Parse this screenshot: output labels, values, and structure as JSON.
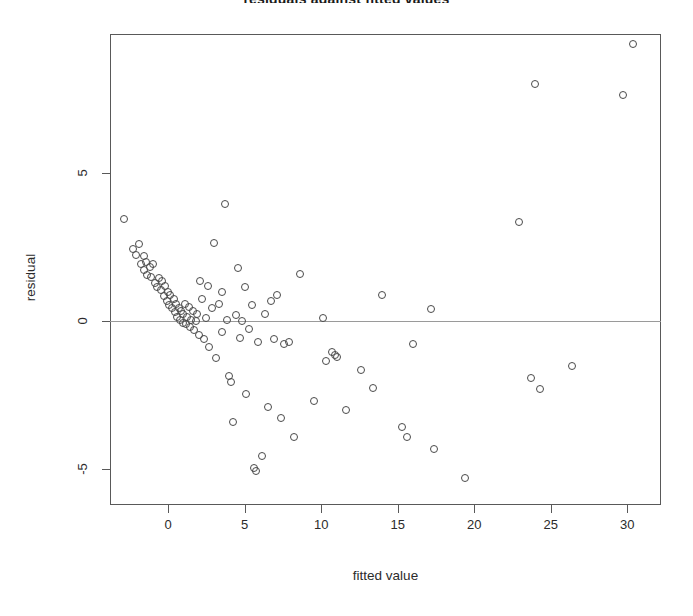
{
  "chart_data": {
    "type": "scatter",
    "title": "residuals against fitted values",
    "xlabel": "fitted value",
    "ylabel": "residual",
    "xlim": [
      -3.8,
      32.2
    ],
    "ylim": [
      -6.2,
      9.7
    ],
    "xticks": [
      0,
      5,
      10,
      15,
      20,
      25,
      30
    ],
    "xticklabels": [
      "0",
      "5",
      "10",
      "15",
      "20",
      "25",
      "30"
    ],
    "yticks": [
      -5,
      0,
      5
    ],
    "yticklabels": [
      "-5",
      "0",
      "5"
    ],
    "grid": false,
    "legend": null,
    "reference_lines": [
      {
        "orientation": "horizontal",
        "y": 0,
        "color": "#9a9a9a"
      }
    ],
    "marker": {
      "shape": "open-circle",
      "size_px": 8,
      "color": "#4a4a4a",
      "fill": "none"
    },
    "n_points": 98,
    "points": [
      [
        -2.9,
        3.45
      ],
      [
        -2.3,
        2.45
      ],
      [
        -2.1,
        2.25
      ],
      [
        -1.9,
        2.6
      ],
      [
        -1.75,
        1.95
      ],
      [
        -1.6,
        2.2
      ],
      [
        -1.55,
        1.75
      ],
      [
        -1.45,
        2.0
      ],
      [
        -1.35,
        1.55
      ],
      [
        -1.2,
        1.85
      ],
      [
        -1.1,
        1.5
      ],
      [
        -1.0,
        1.95
      ],
      [
        -0.85,
        1.3
      ],
      [
        -0.7,
        1.15
      ],
      [
        -0.6,
        1.45
      ],
      [
        -0.5,
        1.05
      ],
      [
        -0.4,
        1.35
      ],
      [
        -0.3,
        0.85
      ],
      [
        -0.2,
        1.2
      ],
      [
        -0.1,
        0.7
      ],
      [
        0.0,
        1.0
      ],
      [
        0.05,
        0.55
      ],
      [
        0.15,
        0.9
      ],
      [
        0.25,
        0.45
      ],
      [
        0.35,
        0.75
      ],
      [
        0.45,
        0.3
      ],
      [
        0.5,
        0.6
      ],
      [
        0.6,
        0.15
      ],
      [
        0.7,
        0.45
      ],
      [
        0.8,
        0.05
      ],
      [
        0.85,
        0.35
      ],
      [
        0.95,
        -0.05
      ],
      [
        1.0,
        0.25
      ],
      [
        1.1,
        0.6
      ],
      [
        1.15,
        -0.1
      ],
      [
        1.25,
        0.15
      ],
      [
        1.35,
        0.5
      ],
      [
        1.45,
        -0.2
      ],
      [
        1.5,
        0.05
      ],
      [
        1.6,
        0.35
      ],
      [
        1.7,
        -0.3
      ],
      [
        1.8,
        0.0
      ],
      [
        1.9,
        0.25
      ],
      [
        2.0,
        -0.45
      ],
      [
        2.1,
        1.35
      ],
      [
        2.2,
        0.75
      ],
      [
        2.35,
        -0.6
      ],
      [
        2.45,
        0.1
      ],
      [
        2.6,
        1.2
      ],
      [
        2.7,
        -0.85
      ],
      [
        2.85,
        0.45
      ],
      [
        3.0,
        2.65
      ],
      [
        3.1,
        -1.25
      ],
      [
        3.3,
        0.6
      ],
      [
        3.5,
        1.0
      ],
      [
        3.55,
        -0.35
      ],
      [
        3.7,
        3.95
      ],
      [
        3.85,
        0.05
      ],
      [
        4.0,
        -1.85
      ],
      [
        4.1,
        -2.05
      ],
      [
        4.25,
        -3.4
      ],
      [
        4.4,
        0.2
      ],
      [
        4.55,
        1.8
      ],
      [
        4.7,
        -0.55
      ],
      [
        4.85,
        0.0
      ],
      [
        5.0,
        1.15
      ],
      [
        5.1,
        -2.45
      ],
      [
        5.3,
        -0.25
      ],
      [
        5.45,
        0.55
      ],
      [
        5.6,
        -4.95
      ],
      [
        5.75,
        -5.05
      ],
      [
        5.9,
        -0.7
      ],
      [
        6.1,
        -4.55
      ],
      [
        6.3,
        0.25
      ],
      [
        6.5,
        -2.9
      ],
      [
        6.7,
        0.7
      ],
      [
        6.9,
        -0.6
      ],
      [
        7.1,
        0.9
      ],
      [
        7.4,
        -3.25
      ],
      [
        7.6,
        -0.75
      ],
      [
        7.9,
        -0.7
      ],
      [
        8.2,
        -3.9
      ],
      [
        8.6,
        1.6
      ],
      [
        9.5,
        -2.7
      ],
      [
        10.1,
        0.1
      ],
      [
        10.3,
        -1.35
      ],
      [
        10.7,
        -1.05
      ],
      [
        10.9,
        -1.15
      ],
      [
        11.0,
        -1.2
      ],
      [
        11.6,
        -3.0
      ],
      [
        12.6,
        -1.65
      ],
      [
        13.4,
        -2.25
      ],
      [
        14.0,
        0.9
      ],
      [
        15.3,
        -3.55
      ],
      [
        15.6,
        -3.9
      ],
      [
        16.0,
        -0.75
      ],
      [
        17.2,
        0.4
      ],
      [
        17.4,
        -4.3
      ],
      [
        19.4,
        -5.3
      ],
      [
        22.9,
        3.35
      ],
      [
        23.7,
        -1.9
      ],
      [
        24.0,
        8.0
      ],
      [
        24.3,
        -2.3
      ],
      [
        26.4,
        -1.5
      ],
      [
        29.7,
        7.65
      ],
      [
        30.4,
        9.35
      ]
    ]
  },
  "axes": {
    "xlabel": "fitted value",
    "ylabel": "residual"
  }
}
